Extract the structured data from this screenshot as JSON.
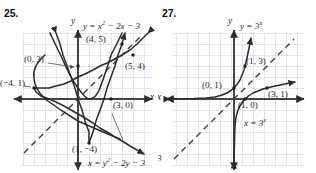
{
  "page": {
    "background_color": "#ffffff",
    "ink_color": "#1f1f1f",
    "grid_color": "#d9d9e2",
    "curve_color": "#2b2b2b",
    "axis_color": "#3a3a3a"
  },
  "figures": [
    {
      "number": "25.",
      "axis_x_label": "x",
      "axis_y_label": "y",
      "equations": [
        {
          "id": "parabola-up",
          "text": "y = x² − 2x − 3",
          "html": "y = x<sup>2</sup> − 2x − 3"
        },
        {
          "id": "parabola-right",
          "text": "x = y² − 2y − 3",
          "html": "x = y<sup>2</sup> − 2y − 3"
        }
      ],
      "points": [
        {
          "label": "(0, 3)",
          "x": 0,
          "y": 3
        },
        {
          "label": "(4, 5)",
          "x": 4,
          "y": 5
        },
        {
          "label": "(5, 4)",
          "x": 5,
          "y": 4
        },
        {
          "label": "(−4, 1)",
          "x": -4,
          "y": 1
        },
        {
          "label": "(3, 0)",
          "x": 3,
          "y": 0
        },
        {
          "label": "(1, −4)",
          "x": 1,
          "y": -4
        }
      ],
      "dashed_line": "y = x"
    },
    {
      "number": "27.",
      "axis_x_label": "x",
      "axis_y_label": "y",
      "equations": [
        {
          "id": "exponential",
          "text": "y = 3ˣ",
          "html": "y = 3<sup>x</sup>"
        },
        {
          "id": "logarithmic",
          "text": "x = 3ʸ",
          "html": "x = 3<sup>y</sup>"
        }
      ],
      "points": [
        {
          "label": "(1, 3)",
          "x": 1,
          "y": 3
        },
        {
          "label": "(0, 1)",
          "x": 0,
          "y": 1
        },
        {
          "label": "(3, 1)",
          "x": 3,
          "y": 1
        },
        {
          "label": "(1, 0)",
          "x": 1,
          "y": 0
        }
      ],
      "dashed_line": "y = x",
      "clipped_fragment": "3"
    }
  ],
  "chart_data": [
    {
      "type": "line",
      "title": "25.",
      "xlabel": "x",
      "ylabel": "y",
      "xlim": [
        -6,
        6
      ],
      "ylim": [
        -6,
        6
      ],
      "grid": true,
      "legend": "none",
      "series": [
        {
          "name": "y = x^2 - 2x - 3",
          "style": "solid",
          "x": [
            -2,
            -1.5,
            -1,
            -0.5,
            0,
            0.5,
            1,
            1.5,
            2,
            2.5,
            3,
            3.5,
            4
          ],
          "values": [
            5,
            2.25,
            0,
            -1.75,
            -3,
            -3.75,
            -4,
            -3.75,
            -3,
            -1.75,
            0,
            2.25,
            5
          ]
        },
        {
          "name": "x = y^2 - 2y - 3",
          "style": "solid",
          "y": [
            -2,
            -1.5,
            -1,
            -0.5,
            0,
            0.5,
            1,
            1.5,
            2,
            2.5,
            3,
            3.5,
            4,
            4.5,
            5
          ],
          "x_values": [
            5,
            2.25,
            0,
            -1.75,
            -3,
            -3.75,
            -4,
            -3.75,
            -3,
            -1.75,
            0,
            2.25,
            5,
            8.25,
            12
          ]
        },
        {
          "name": "y = x",
          "style": "dashed",
          "x": [
            -6,
            6
          ],
          "values": [
            -6,
            6
          ]
        }
      ],
      "annotations": [
        {
          "text": "(0, 3)",
          "x": 0,
          "y": 3
        },
        {
          "text": "(4, 5)",
          "x": 4,
          "y": 5
        },
        {
          "text": "(5, 4)",
          "x": 5,
          "y": 4
        },
        {
          "text": "(-4, 1)",
          "x": -4,
          "y": 1
        },
        {
          "text": "(3, 0)",
          "x": 3,
          "y": 0
        },
        {
          "text": "(1, -4)",
          "x": 1,
          "y": -4
        }
      ]
    },
    {
      "type": "line",
      "title": "27.",
      "xlabel": "x",
      "ylabel": "y",
      "xlim": [
        -6,
        6
      ],
      "ylim": [
        -6,
        6
      ],
      "grid": true,
      "legend": "none",
      "series": [
        {
          "name": "y = 3^x",
          "style": "solid",
          "x": [
            -5,
            -4,
            -3,
            -2,
            -1,
            -0.5,
            0,
            0.5,
            1,
            1.5
          ],
          "values": [
            0.004,
            0.012,
            0.037,
            0.111,
            0.333,
            0.577,
            1,
            1.732,
            3,
            5.196
          ]
        },
        {
          "name": "x = 3^y",
          "style": "solid",
          "y": [
            -5,
            -4,
            -3,
            -2,
            -1,
            -0.5,
            0,
            0.5,
            1,
            1.5
          ],
          "x_values": [
            0.004,
            0.012,
            0.037,
            0.111,
            0.333,
            0.577,
            1,
            1.732,
            3,
            5.196
          ]
        },
        {
          "name": "y = x",
          "style": "dashed",
          "x": [
            -6,
            6
          ],
          "values": [
            -6,
            6
          ]
        }
      ],
      "annotations": [
        {
          "text": "(1, 3)",
          "x": 1,
          "y": 3
        },
        {
          "text": "(0, 1)",
          "x": 0,
          "y": 1
        },
        {
          "text": "(3, 1)",
          "x": 3,
          "y": 1
        },
        {
          "text": "(1, 0)",
          "x": 1,
          "y": 0
        }
      ]
    }
  ]
}
